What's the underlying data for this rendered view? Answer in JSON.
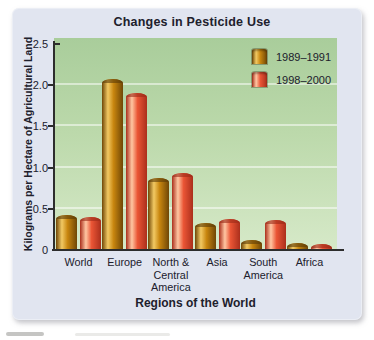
{
  "figure": {
    "type": "scanned textbook bar chart"
  },
  "colors": {
    "card_background": "#e1e5f0",
    "plot_gradient_top": "#a9cd9b",
    "plot_gradient_bottom": "#d6e9c8",
    "axis": "#2d2d2d",
    "text": "#20202c",
    "gridline": "rgba(255,255,255,0.5)",
    "series_1989_1991": {
      "edge": "#6f4606",
      "highlight": "#f2c963",
      "mid": "#c8860f",
      "cap": "#5a3a06"
    },
    "series_1998_2000": {
      "edge": "#ab2f1c",
      "highlight": "#ffc6a2",
      "mid": "#ea5535",
      "cap": "#9b2a17"
    }
  },
  "chart_data": {
    "type": "bar",
    "title": "Changes in Pesticide Use",
    "xlabel": "Regions of the World",
    "ylabel": "Kilograms per Hectare of Agricultural Land",
    "ylim": [
      0,
      2.5
    ],
    "y_ticks": [
      "0",
      "0.5",
      "1.0",
      "1.5",
      "2.0",
      "2.5"
    ],
    "gridlines": [
      0.5,
      1.0,
      1.5,
      2.0
    ],
    "grid": true,
    "legend_position": "top-right inside plot",
    "categories": [
      "World",
      "Europe",
      "North &\nCentral\nAmerica",
      "Asia",
      "South\nAmerica",
      "Africa"
    ],
    "series": [
      {
        "name": "1989–1991",
        "values": [
          0.42,
          2.08,
          0.88,
          0.33,
          0.12,
          0.09
        ]
      },
      {
        "name": "1998–2000",
        "values": [
          0.4,
          1.91,
          0.93,
          0.38,
          0.37,
          0.07
        ]
      }
    ]
  }
}
